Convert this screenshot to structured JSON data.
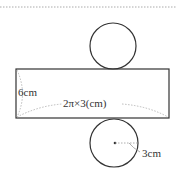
{
  "figure": {
    "type": "cylinder-net",
    "height_label": "6cm",
    "length_label": "2π×3(cm)",
    "radius_label": "3cm",
    "colors": {
      "stroke": "#333333",
      "dashed": "#999999",
      "dotted_rule": "#aaaaaa"
    }
  }
}
